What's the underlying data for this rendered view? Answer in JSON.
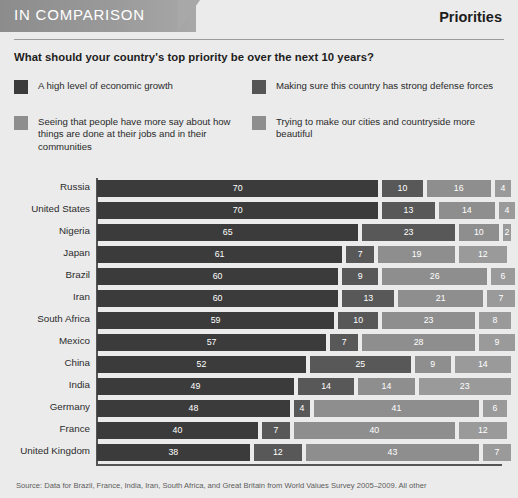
{
  "header": {
    "tab_label": "IN COMPARISON",
    "section_title": "Priorities"
  },
  "question": "What should your country's top priority be over the next 10 years?",
  "legend": [
    {
      "key": "growth",
      "label": "A high level of economic growth",
      "color": "#3b3b3b"
    },
    {
      "key": "defense",
      "label": "Making sure this country has strong defense forces",
      "color": "#585858"
    },
    {
      "key": "say",
      "label": "Seeing that people have more say about how things are done at their jobs and in their communities",
      "color": "#8e8e8e"
    },
    {
      "key": "beauty",
      "label": "Trying to make our cities and countryside more beautiful",
      "color": "#9a9a9a"
    }
  ],
  "source": "Source: Data for Brazil, France, India, Iran, South Africa, and Great Britain from World Values Survey 2005–2009. All other",
  "chart_data": {
    "type": "bar",
    "orientation": "horizontal",
    "stacked": true,
    "title": "Priorities",
    "subtitle": "What should your country's top priority be over the next 10 years?",
    "xlabel": "",
    "ylabel": "",
    "xlim": [
      0,
      100
    ],
    "grid": false,
    "legend_position": "top",
    "value_unit": "percent",
    "categories": [
      "Russia",
      "United States",
      "Nigeria",
      "Japan",
      "Brazil",
      "Iran",
      "South Africa",
      "Mexico",
      "China",
      "India",
      "Germany",
      "France",
      "United Kingdom"
    ],
    "series": [
      {
        "name": "A high level of economic growth",
        "color": "#3b3b3b",
        "values": [
          70,
          70,
          65,
          61,
          60,
          60,
          59,
          57,
          52,
          49,
          48,
          40,
          38
        ]
      },
      {
        "name": "Making sure this country has strong defense forces",
        "color": "#585858",
        "values": [
          10,
          13,
          23,
          7,
          9,
          13,
          10,
          7,
          25,
          14,
          4,
          7,
          12
        ]
      },
      {
        "name": "Seeing that people have more say about how things are done at their jobs and in their communities",
        "color": "#8e8e8e",
        "values": [
          16,
          14,
          10,
          19,
          26,
          21,
          23,
          28,
          9,
          14,
          41,
          40,
          43
        ]
      },
      {
        "name": "Trying to make our cities and countryside more beautiful",
        "color": "#9a9a9a",
        "values": [
          4,
          4,
          2,
          12,
          6,
          7,
          8,
          9,
          14,
          23,
          6,
          12,
          7
        ]
      }
    ]
  }
}
